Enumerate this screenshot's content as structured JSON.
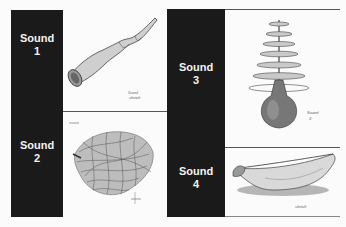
{
  "sounds": [
    {
      "title": "Sound",
      "number": "1",
      "illustration": "twisted-horn-sketch"
    },
    {
      "title": "Sound",
      "number": "2",
      "illustration": "tangled-wire-ball-sketch"
    },
    {
      "title": "Sound",
      "number": "3",
      "illustration": "stacked-disc-gourd-sketch"
    },
    {
      "title": "Sound",
      "number": "4",
      "illustration": "canoe-bowl-sketch"
    }
  ],
  "colors": {
    "panel": "#1a1a1a",
    "label": "#f2f2f2",
    "background": "#fbfbfb",
    "rule": "#555555"
  }
}
